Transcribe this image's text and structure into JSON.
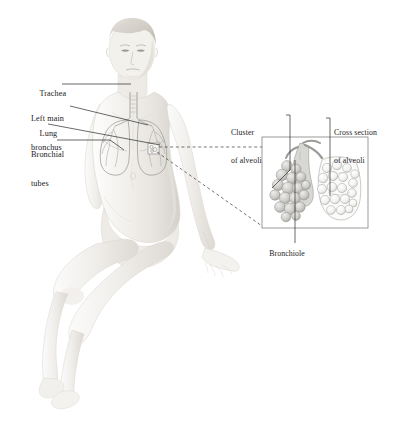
{
  "figure": {
    "background_color": "#ffffff",
    "ink_color": "#1a1a1a",
    "skin_light": "#f4f2ef",
    "skin_mid": "#e6e3de",
    "skin_shadow": "#cfccc6",
    "organ_line": "#8a8a88",
    "alveoli_fill": "#cfcecb",
    "alveoli_light": "#efefed"
  },
  "body_labels": [
    {
      "id": "trachea",
      "text": "Trachea",
      "lines": [
        "Trachea"
      ]
    },
    {
      "id": "left-main-bronchus",
      "text": "Left main bronchus",
      "lines": [
        "Left main",
        "bronchus"
      ]
    },
    {
      "id": "lung",
      "text": "Lung",
      "lines": [
        "Lung"
      ]
    },
    {
      "id": "bronchial-tubes",
      "text": "Bronchial tubes",
      "lines": [
        "Bronchial",
        "tubes"
      ]
    }
  ],
  "inset_labels": [
    {
      "id": "cluster-of-alveoli",
      "text": "Cluster of alveoli",
      "lines": [
        "Cluster",
        "of alveoli"
      ]
    },
    {
      "id": "cross-section-of-alveoli",
      "text": "Cross section of alveoli",
      "lines": [
        "Cross section",
        "of alveoli"
      ]
    },
    {
      "id": "bronchiole",
      "text": "Bronchiole",
      "lines": [
        "Bronchiole"
      ]
    }
  ],
  "label_text": {
    "trachea": "Trachea",
    "left_main_bronchus_1": "Left main",
    "left_main_bronchus_2": "bronchus",
    "lung": "Lung",
    "bronchial_tubes_1": "Bronchial",
    "bronchial_tubes_2": "tubes",
    "cluster_1": "Cluster",
    "cluster_2": "of alveoli",
    "cross_section_1": "Cross section",
    "cross_section_2": "of alveoli",
    "bronchiole": "Bronchiole"
  },
  "inset": {
    "caption": "Magnified detail of alveoli",
    "box": {
      "x": 262,
      "y": 137,
      "width": 106,
      "height": 91
    }
  }
}
